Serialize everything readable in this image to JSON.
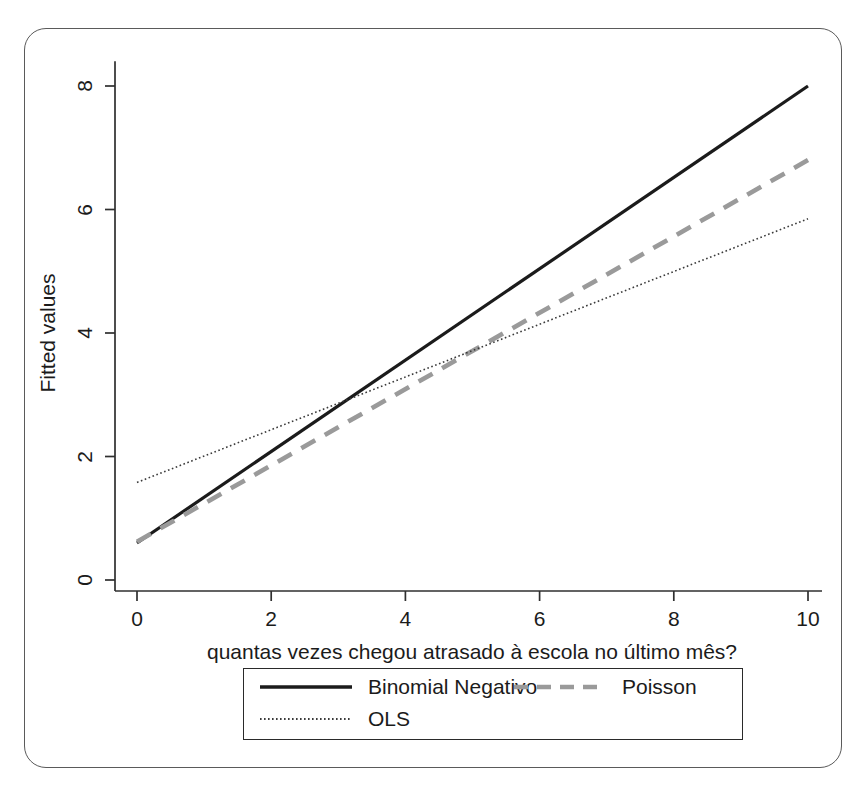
{
  "figure": {
    "background_color": "#ffffff",
    "frame_color": "#5a5a5a"
  },
  "chart_data": {
    "type": "line",
    "title": "",
    "subtitle": "",
    "xlabel": "quantas vezes chegou atrasado à escola no último mês?",
    "ylabel": "Fitted values",
    "xlim": [
      0,
      10
    ],
    "ylim": [
      0,
      8.4
    ],
    "xticks": [
      0,
      2,
      4,
      6,
      8,
      10
    ],
    "yticks": [
      0,
      2,
      4,
      6,
      8
    ],
    "xtick_labels": [
      "0",
      "2",
      "4",
      "6",
      "8",
      "10"
    ],
    "ytick_labels": [
      "0",
      "2",
      "4",
      "6",
      "8"
    ],
    "grid": false,
    "legend_position": "below-axes",
    "x": [
      0,
      10
    ],
    "series": [
      {
        "name": "Binomial Negativo",
        "values": [
          0.6,
          8.0
        ],
        "color": "#1b1b1b",
        "style": "solid",
        "width": 3.2
      },
      {
        "name": "Poisson",
        "values": [
          0.62,
          6.8
        ],
        "color": "#9a9a9a",
        "style": "dashed",
        "width": 4.6
      },
      {
        "name": "OLS",
        "values": [
          1.58,
          5.85
        ],
        "color": "#3a3a3a",
        "style": "dotted",
        "width": 1.6
      }
    ]
  },
  "legend": {
    "items": [
      {
        "label": "Binomial Negativo"
      },
      {
        "label": "Poisson"
      },
      {
        "label": "OLS"
      }
    ]
  }
}
